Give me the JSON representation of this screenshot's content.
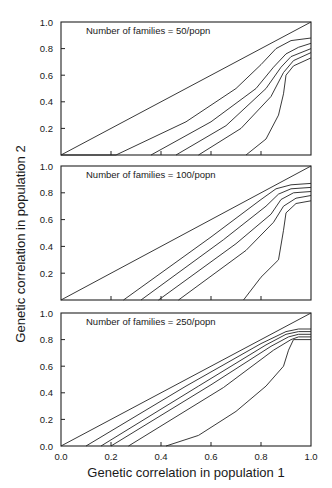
{
  "figure": {
    "ylabel": "Genetic correlation in population 2",
    "xlabel": "Genetic correlation in population 1",
    "x_ticks": [
      "0.0",
      "0.2",
      "0.4",
      "0.6",
      "0.8",
      "1.0"
    ],
    "panel_y_ticks": [
      "0.2",
      "0.4",
      "0.6",
      "0.8",
      "1.0"
    ],
    "bottom_panel_y_ticks": [
      "0.0",
      "0.2",
      "0.4",
      "0.6",
      "0.8",
      "1.0"
    ]
  },
  "chart_data": [
    {
      "type": "line",
      "title": "Number of families = 50/popn",
      "xlabel": "Genetic correlation in population 1",
      "ylabel": "Genetic correlation in population 2",
      "xlim": [
        0,
        1
      ],
      "ylim": [
        0,
        1
      ],
      "grid": false,
      "series": [
        {
          "name": "curve-1",
          "points": [
            [
              0.0,
              0.0
            ],
            [
              1.0,
              1.0
            ]
          ]
        },
        {
          "name": "curve-2",
          "points": [
            [
              0.0,
              0.0
            ],
            [
              0.22,
              0.0
            ],
            [
              0.5,
              0.25
            ],
            [
              0.7,
              0.5
            ],
            [
              0.8,
              0.68
            ],
            [
              0.86,
              0.8
            ],
            [
              0.92,
              0.86
            ],
            [
              1.0,
              0.88
            ]
          ]
        },
        {
          "name": "curve-3",
          "points": [
            [
              0.36,
              0.0
            ],
            [
              0.6,
              0.25
            ],
            [
              0.78,
              0.5
            ],
            [
              0.85,
              0.66
            ],
            [
              0.9,
              0.76
            ],
            [
              0.95,
              0.81
            ],
            [
              1.0,
              0.84
            ]
          ]
        },
        {
          "name": "curve-4",
          "points": [
            [
              0.46,
              0.0
            ],
            [
              0.66,
              0.22
            ],
            [
              0.82,
              0.5
            ],
            [
              0.88,
              0.66
            ],
            [
              0.92,
              0.74
            ],
            [
              1.0,
              0.8
            ]
          ]
        },
        {
          "name": "curve-5",
          "points": [
            [
              0.55,
              0.0
            ],
            [
              0.72,
              0.2
            ],
            [
              0.84,
              0.44
            ],
            [
              0.89,
              0.62
            ],
            [
              0.93,
              0.71
            ],
            [
              1.0,
              0.77
            ]
          ]
        },
        {
          "name": "curve-6",
          "points": [
            [
              0.74,
              0.0
            ],
            [
              0.82,
              0.12
            ],
            [
              0.87,
              0.3
            ],
            [
              0.89,
              0.46
            ],
            [
              0.9,
              0.6
            ],
            [
              0.93,
              0.67
            ],
            [
              1.0,
              0.73
            ]
          ]
        }
      ]
    },
    {
      "type": "line",
      "title": "Number of families = 100/popn",
      "xlabel": "Genetic correlation in population 1",
      "ylabel": "Genetic correlation in population 2",
      "xlim": [
        0,
        1
      ],
      "ylim": [
        0,
        1
      ],
      "grid": false,
      "series": [
        {
          "name": "curve-1",
          "points": [
            [
              0.0,
              0.0
            ],
            [
              1.0,
              1.0
            ]
          ]
        },
        {
          "name": "curve-2",
          "points": [
            [
              0.25,
              0.0
            ],
            [
              0.6,
              0.47
            ],
            [
              0.8,
              0.75
            ],
            [
              0.86,
              0.83
            ],
            [
              0.92,
              0.86
            ],
            [
              1.0,
              0.87
            ]
          ]
        },
        {
          "name": "curve-3",
          "points": [
            [
              0.32,
              0.0
            ],
            [
              0.65,
              0.45
            ],
            [
              0.82,
              0.7
            ],
            [
              0.87,
              0.79
            ],
            [
              0.92,
              0.83
            ],
            [
              1.0,
              0.84
            ]
          ]
        },
        {
          "name": "curve-4",
          "points": [
            [
              0.39,
              0.0
            ],
            [
              0.7,
              0.42
            ],
            [
              0.84,
              0.64
            ],
            [
              0.88,
              0.75
            ],
            [
              0.93,
              0.8
            ],
            [
              1.0,
              0.81
            ]
          ]
        },
        {
          "name": "curve-5",
          "points": [
            [
              0.47,
              0.0
            ],
            [
              0.74,
              0.37
            ],
            [
              0.85,
              0.58
            ],
            [
              0.89,
              0.7
            ],
            [
              0.94,
              0.76
            ],
            [
              1.0,
              0.78
            ]
          ]
        },
        {
          "name": "curve-6",
          "points": [
            [
              0.73,
              0.0
            ],
            [
              0.8,
              0.17
            ],
            [
              0.87,
              0.3
            ],
            [
              0.89,
              0.52
            ],
            [
              0.9,
              0.65
            ],
            [
              0.94,
              0.72
            ],
            [
              1.0,
              0.74
            ]
          ]
        }
      ]
    },
    {
      "type": "line",
      "title": "Number of families = 250/popn",
      "xlabel": "Genetic correlation in population 1",
      "ylabel": "Genetic correlation in population 2",
      "xlim": [
        0,
        1
      ],
      "ylim": [
        0,
        1
      ],
      "grid": false,
      "series": [
        {
          "name": "curve-1",
          "points": [
            [
              0.0,
              0.0
            ],
            [
              1.0,
              1.0
            ]
          ]
        },
        {
          "name": "curve-2",
          "points": [
            [
              0.1,
              0.0
            ],
            [
              0.5,
              0.45
            ],
            [
              0.8,
              0.77
            ],
            [
              0.9,
              0.86
            ],
            [
              0.95,
              0.88
            ],
            [
              1.0,
              0.88
            ]
          ]
        },
        {
          "name": "curve-3",
          "points": [
            [
              0.16,
              0.0
            ],
            [
              0.55,
              0.45
            ],
            [
              0.82,
              0.76
            ],
            [
              0.9,
              0.84
            ],
            [
              0.95,
              0.86
            ],
            [
              1.0,
              0.86
            ]
          ]
        },
        {
          "name": "curve-4",
          "points": [
            [
              0.2,
              0.0
            ],
            [
              0.6,
              0.46
            ],
            [
              0.84,
              0.75
            ],
            [
              0.91,
              0.82
            ],
            [
              0.95,
              0.84
            ],
            [
              1.0,
              0.84
            ]
          ]
        },
        {
          "name": "curve-5",
          "points": [
            [
              0.27,
              0.0
            ],
            [
              0.65,
              0.44
            ],
            [
              0.85,
              0.72
            ],
            [
              0.92,
              0.8
            ],
            [
              0.95,
              0.82
            ],
            [
              1.0,
              0.82
            ]
          ]
        },
        {
          "name": "curve-6",
          "points": [
            [
              0.42,
              0.0
            ],
            [
              0.55,
              0.08
            ],
            [
              0.7,
              0.26
            ],
            [
              0.82,
              0.45
            ],
            [
              0.89,
              0.6
            ],
            [
              0.91,
              0.72
            ],
            [
              0.93,
              0.8
            ],
            [
              1.0,
              0.8
            ]
          ]
        }
      ]
    }
  ]
}
